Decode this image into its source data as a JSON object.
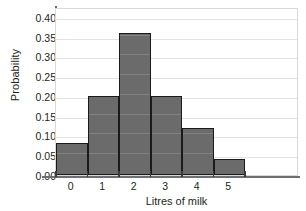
{
  "chart_data": {
    "type": "bar",
    "title": "",
    "xlabel": "Litres of milk",
    "ylabel": "Probability",
    "categories": [
      "0",
      "1",
      "2",
      "3",
      "4",
      "5"
    ],
    "values": [
      0.08,
      0.2,
      0.36,
      0.2,
      0.12,
      0.04
    ],
    "ylim": [
      0.0,
      0.425
    ],
    "yticks": [
      "0.00",
      "0.05",
      "0.10",
      "0.15",
      "0.20",
      "0.25",
      "0.30",
      "0.35",
      "0.40"
    ],
    "ytick_values": [
      0.0,
      0.05,
      0.1,
      0.15,
      0.2,
      0.25,
      0.3,
      0.35,
      0.4
    ],
    "grid": true,
    "legend": "none",
    "bar_color": "#6b6b6b",
    "bar_edge_color": "#1a1a1a",
    "grid_color": "#e3e3e3",
    "axis_color": "#6d6e71"
  }
}
